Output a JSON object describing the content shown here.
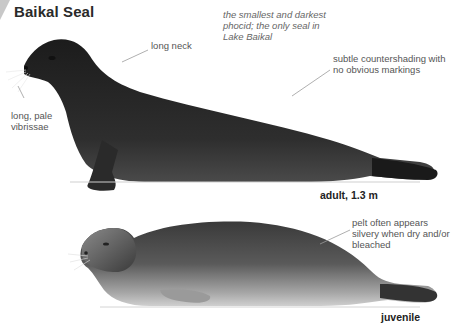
{
  "title": "Baikal Seal",
  "annotations": {
    "summary": "the smallest and darkest phocid; the only seal in Lake Baikal",
    "long_neck": "long neck",
    "countershading": "subtle countershading with no obvious markings",
    "vibrissae": "long, pale vibrissae",
    "pelt": "pelt often appears silvery when dry and/or bleached"
  },
  "figures": [
    {
      "label": "adult, 1.3 m",
      "stage": "adult"
    },
    {
      "label": "juvenile",
      "stage": "juvenile"
    }
  ],
  "colors": {
    "adult_body": "#2b2b2b",
    "juvenile_body": "#3e3e3e",
    "juvenile_belly": "#bdbdbd",
    "annotation_text": "#555555",
    "leader_line": "#9a9a9a"
  }
}
